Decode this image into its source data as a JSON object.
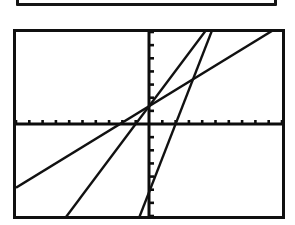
{
  "screen": {
    "label": "graphing-calculator-screen",
    "background_color": "#ffffff",
    "border_color": "#101010"
  },
  "partial_box": {
    "label": "partial-box-above",
    "border_color": "#151515"
  },
  "chart_data": {
    "type": "line",
    "title": "",
    "subtitle": "",
    "xlabel": "",
    "ylabel": "",
    "grid": false,
    "legend_position": "none",
    "axis_color": "#0d0d0d",
    "line_color": "#111111",
    "xlim": [
      -10,
      10
    ],
    "ylim": [
      -7,
      7
    ],
    "x_tick_step": 1,
    "y_tick_step": 1,
    "x_tick_count": 20,
    "y_tick_count": 14,
    "axes": {
      "x_axis_visible": true,
      "y_axis_visible": true,
      "origin_x": 0,
      "origin_y": 0
    },
    "annotations": [
      "three straight lines of differing slope",
      "all lines pass near a common point just above the origin"
    ],
    "series": [
      {
        "name": "line-1-shallow",
        "slope": 0.62,
        "intercept": 1.35,
        "x": [
          -10,
          10
        ],
        "y": [
          -4.85,
          7.55
        ],
        "x_intercept": -2.2,
        "y_intercept": 1.35,
        "description": "least steep line, enters at lower-left edge"
      },
      {
        "name": "line-2-medium",
        "slope": 1.35,
        "intercept": 1.35,
        "x": [
          -10,
          10
        ],
        "y": [
          -12.15,
          14.85
        ],
        "x_intercept": -1.0,
        "y_intercept": 1.35,
        "description": "medium slope line, exits through top-right"
      },
      {
        "name": "line-3-steep",
        "slope": 2.6,
        "intercept": -5.2,
        "x": [
          -10,
          10
        ],
        "y": [
          -31.2,
          20.8
        ],
        "x_intercept": 2.0,
        "y_intercept": -5.2,
        "description": "steepest line, crosses x-axis right of origin"
      }
    ]
  }
}
